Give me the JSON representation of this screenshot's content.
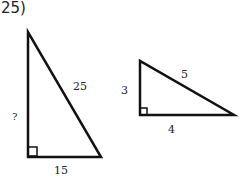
{
  "problem": {
    "number": "25)"
  },
  "triangles": [
    {
      "id": "left",
      "legs": [
        "?",
        "15"
      ],
      "hypotenuse": "25",
      "right_angle": true
    },
    {
      "id": "right",
      "legs": [
        "3",
        "4"
      ],
      "hypotenuse": "5",
      "right_angle": true
    }
  ],
  "labels": {
    "left_vertical": "?",
    "left_hyp": "25",
    "left_base": "15",
    "right_vertical": "3",
    "right_hyp": "5",
    "right_base": "4"
  },
  "colors": {
    "stroke": "#111111",
    "background": "#ffffff"
  }
}
